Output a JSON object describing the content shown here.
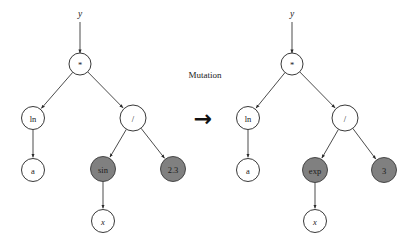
{
  "figure": {
    "background_color": "#ffffff",
    "edge_color": "#2a2a2a",
    "node_fill": "#ffffff",
    "node_stroke": "#222222",
    "shaded_fill": "#808080"
  },
  "center": {
    "caption": "Mutation",
    "arrow_glyph": "→"
  },
  "left_tree": {
    "name": "before-mutation",
    "root_input_label": "y",
    "nodes": [
      {
        "id": "L-root",
        "label": "*",
        "shaded": false,
        "cx": 80,
        "cy": 64,
        "r": 11
      },
      {
        "id": "L-ln",
        "label": "ln",
        "shaded": false,
        "cx": 33,
        "cy": 118,
        "r": 11.5
      },
      {
        "id": "L-div",
        "label": "/",
        "shaded": false,
        "cx": 133,
        "cy": 118,
        "r": 13
      },
      {
        "id": "L-a",
        "label": "a",
        "shaded": false,
        "cx": 33,
        "cy": 170,
        "r": 11.5
      },
      {
        "id": "L-sin",
        "label": "sin",
        "shaded": true,
        "cx": 103,
        "cy": 169,
        "r": 12.5
      },
      {
        "id": "L-23",
        "label": "2.3",
        "shaded": true,
        "cx": 173,
        "cy": 169,
        "r": 12.5
      },
      {
        "id": "L-x",
        "label": "x",
        "shaded": false,
        "cx": 103,
        "cy": 221,
        "r": 11.5
      }
    ],
    "edges": [
      {
        "from": "input",
        "to": "L-root"
      },
      {
        "from": "L-root",
        "to": "L-ln"
      },
      {
        "from": "L-root",
        "to": "L-div"
      },
      {
        "from": "L-ln",
        "to": "L-a"
      },
      {
        "from": "L-div",
        "to": "L-sin"
      },
      {
        "from": "L-div",
        "to": "L-23"
      },
      {
        "from": "L-sin",
        "to": "L-x"
      }
    ],
    "expression": "y = ln(a) * ( sin(x) / 2.3 )"
  },
  "right_tree": {
    "name": "after-mutation",
    "root_input_label": "y",
    "nodes": [
      {
        "id": "R-root",
        "label": "*",
        "shaded": false,
        "cx": 292,
        "cy": 64,
        "r": 11
      },
      {
        "id": "R-ln",
        "label": "ln",
        "shaded": false,
        "cx": 248,
        "cy": 118,
        "r": 11.5
      },
      {
        "id": "R-div",
        "label": "/",
        "shaded": false,
        "cx": 345,
        "cy": 118,
        "r": 13
      },
      {
        "id": "R-a",
        "label": "a",
        "shaded": false,
        "cx": 248,
        "cy": 170,
        "r": 11.5
      },
      {
        "id": "R-exp",
        "label": "exp",
        "shaded": true,
        "cx": 315,
        "cy": 170,
        "r": 12.5
      },
      {
        "id": "R-3",
        "label": "3",
        "shaded": true,
        "cx": 384,
        "cy": 170,
        "r": 12.5
      },
      {
        "id": "R-x",
        "label": "x",
        "shaded": false,
        "cx": 315,
        "cy": 221,
        "r": 11.5
      }
    ],
    "edges": [
      {
        "from": "input",
        "to": "R-root"
      },
      {
        "from": "R-root",
        "to": "R-ln"
      },
      {
        "from": "R-root",
        "to": "R-div"
      },
      {
        "from": "R-ln",
        "to": "R-a"
      },
      {
        "from": "R-div",
        "to": "R-exp"
      },
      {
        "from": "R-div",
        "to": "R-3"
      },
      {
        "from": "R-exp",
        "to": "R-x"
      }
    ],
    "expression": "y = ln(a) * ( exp(x) / 3 )"
  }
}
